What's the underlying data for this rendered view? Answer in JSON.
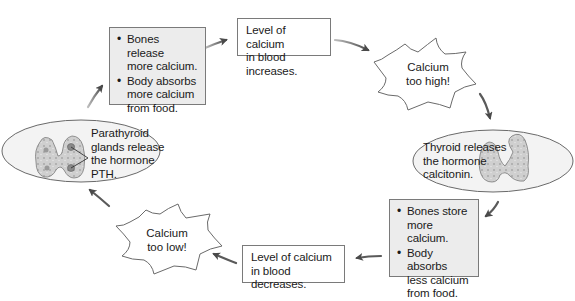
{
  "diagram": {
    "nodes": {
      "increase_level": {
        "text": "Level of calcium in blood increases.",
        "lines": [
          "Level of calcium",
          "in blood increases."
        ]
      },
      "too_high": {
        "lines": [
          "Calcium",
          "too high!"
        ]
      },
      "thyroid": {
        "lines": [
          "Thyroid releases",
          "the hormone",
          "calcitonin."
        ]
      },
      "high_response": {
        "bullets": [
          {
            "lines": [
              "Bones store",
              "more calcium."
            ]
          },
          {
            "lines": [
              "Body absorbs",
              "less calcium",
              "from food."
            ]
          }
        ]
      },
      "decrease_level": {
        "lines": [
          "Level of calcium",
          "in blood decreases."
        ]
      },
      "too_low": {
        "lines": [
          "Calcium",
          "too low!"
        ]
      },
      "parathyroid": {
        "lines": [
          "Parathyroid",
          "glands release",
          "the hormone",
          "PTH."
        ]
      },
      "low_response": {
        "bullets": [
          {
            "lines": [
              "Bones release",
              "more calcium."
            ]
          },
          {
            "lines": [
              "Body absorbs",
              "more calcium",
              "from food."
            ]
          }
        ]
      }
    },
    "colors": {
      "box_border": "#7a7a7a",
      "shaded_fill": "#ececec",
      "ellipse_fill": "#f3f3f3",
      "arrow": "#555555",
      "gland_fill": "#c9c9c9"
    }
  }
}
